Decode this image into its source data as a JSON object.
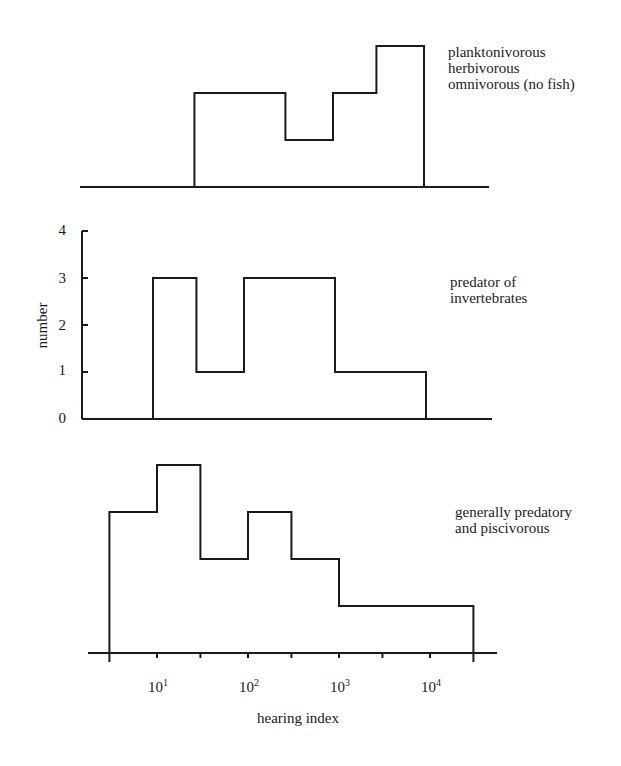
{
  "chart_data": {
    "type": "bar",
    "subtype": "stepped histogram (3 stacked panels, shared log x-axis)",
    "xlabel": "hearing index",
    "ylabel": "number",
    "x_scale": "log",
    "x_ticks": [
      3,
      10,
      30,
      100,
      300,
      1000,
      3000,
      10000,
      30000
    ],
    "x_tick_labels": [
      {
        "value": 10,
        "base": "10",
        "exp": "1"
      },
      {
        "value": 100,
        "base": "10",
        "exp": "2"
      },
      {
        "value": 1000,
        "base": "10",
        "exp": "3"
      },
      {
        "value": 10000,
        "base": "10",
        "exp": "4"
      }
    ],
    "y_ticks": [
      "0",
      "1",
      "2",
      "3",
      "4"
    ],
    "ylim": [
      0,
      4
    ],
    "bin_edges": [
      3,
      10,
      30,
      100,
      300,
      1000,
      3000,
      10000,
      30000
    ],
    "panels": [
      {
        "name": "planktonivorous-herbivorous-omnivorous",
        "label_lines": [
          "planktonivorous",
          "herbivorous",
          "omnivorous (no fish)"
        ],
        "bins": [
          {
            "from": 30,
            "to": 300,
            "count": 2
          },
          {
            "from": 300,
            "to": 1000,
            "count": 1
          },
          {
            "from": 1000,
            "to": 3000,
            "count": 2
          },
          {
            "from": 3000,
            "to": 10000,
            "count": 3
          }
        ]
      },
      {
        "name": "predator-of-invertebrates",
        "label_lines": [
          "predator of",
          "invertebrates"
        ],
        "bins": [
          {
            "from": 10,
            "to": 30,
            "count": 3
          },
          {
            "from": 30,
            "to": 100,
            "count": 1
          },
          {
            "from": 100,
            "to": 1000,
            "count": 3
          },
          {
            "from": 1000,
            "to": 10000,
            "count": 1
          }
        ]
      },
      {
        "name": "generally-predatory-and-piscivorous",
        "label_lines": [
          "generally predatory",
          "and piscivorous"
        ],
        "bins": [
          {
            "from": 3,
            "to": 10,
            "count": 3
          },
          {
            "from": 10,
            "to": 30,
            "count": 4
          },
          {
            "from": 30,
            "to": 100,
            "count": 2
          },
          {
            "from": 100,
            "to": 300,
            "count": 3
          },
          {
            "from": 300,
            "to": 1000,
            "count": 2
          },
          {
            "from": 1000,
            "to": 30000,
            "count": 1
          }
        ]
      }
    ],
    "grid": false,
    "legend": "none (panel labels at right)"
  },
  "axis": {
    "xlabel": "hearing index",
    "ylabel": "number",
    "yticks": [
      "0",
      "1",
      "2",
      "3",
      "4"
    ],
    "xticks": [
      {
        "base": "10",
        "exp": "1"
      },
      {
        "base": "10",
        "exp": "2"
      },
      {
        "base": "10",
        "exp": "3"
      },
      {
        "base": "10",
        "exp": "4"
      }
    ]
  },
  "labels": {
    "panel1": [
      "planktonivorous",
      "herbivorous",
      "omnivorous (no fish)"
    ],
    "panel2": [
      "predator of",
      "invertebrates"
    ],
    "panel3": [
      "generally predatory",
      "and piscivorous"
    ]
  },
  "colors": {
    "line": "#1a1a1a",
    "background": "#ffffff"
  }
}
